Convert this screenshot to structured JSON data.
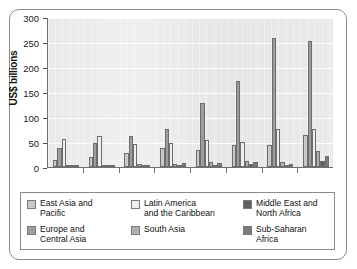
{
  "chart_data": {
    "type": "bar",
    "title": "",
    "xlabel": "Year",
    "ylabel": "US$ billions",
    "ylim": [
      0,
      300
    ],
    "yticks": [
      0,
      50,
      100,
      150,
      200,
      250,
      300
    ],
    "grid": true,
    "legend_position": "bottom",
    "categories": [
      "2000",
      "2001",
      "2002",
      "2003",
      "2004",
      "2005",
      "2006",
      "2007"
    ],
    "series": [
      {
        "name": "East Asia and\nPacific",
        "color": "#c9c9c9",
        "values": [
          15,
          21,
          29,
          39,
          35,
          45,
          44,
          65
        ]
      },
      {
        "name": "Europe and\nCentral Asia",
        "color": "#9d9d9d",
        "values": [
          38,
          48,
          62,
          77,
          129,
          172,
          259,
          253
        ]
      },
      {
        "name": "Latin America\nand the Caribbean",
        "color": "#efefef",
        "values": [
          57,
          63,
          46,
          49,
          55,
          50,
          77,
          77
        ]
      },
      {
        "name": "South Asia",
        "color": "#b0b0b0",
        "values": [
          2,
          2,
          6,
          7,
          11,
          12,
          11,
          33
        ]
      },
      {
        "name": "Middle East and\nNorth Africa",
        "color": "#606060",
        "values": [
          2,
          2,
          3,
          4,
          4,
          7,
          5,
          13
        ]
      },
      {
        "name": "Sub-Saharan\nAfrica",
        "color": "#7a7a7a",
        "values": [
          3,
          3,
          4,
          8,
          8,
          11,
          7,
          22
        ]
      }
    ]
  },
  "legend": {
    "entries": [
      {
        "label": "East Asia and\nPacific",
        "color": "#c9c9c9"
      },
      {
        "label": "Latin America\nand the Caribbean",
        "color": "#efefef"
      },
      {
        "label": "Middle East and\nNorth Africa",
        "color": "#606060"
      },
      {
        "label": "Europe and\nCentral Asia",
        "color": "#9d9d9d"
      },
      {
        "label": "South Asia",
        "color": "#b0b0b0"
      },
      {
        "label": "Sub-Saharan\nAfrica",
        "color": "#7a7a7a"
      }
    ]
  },
  "axis": {
    "y_title": "US$ billions",
    "x_title": "Year"
  }
}
